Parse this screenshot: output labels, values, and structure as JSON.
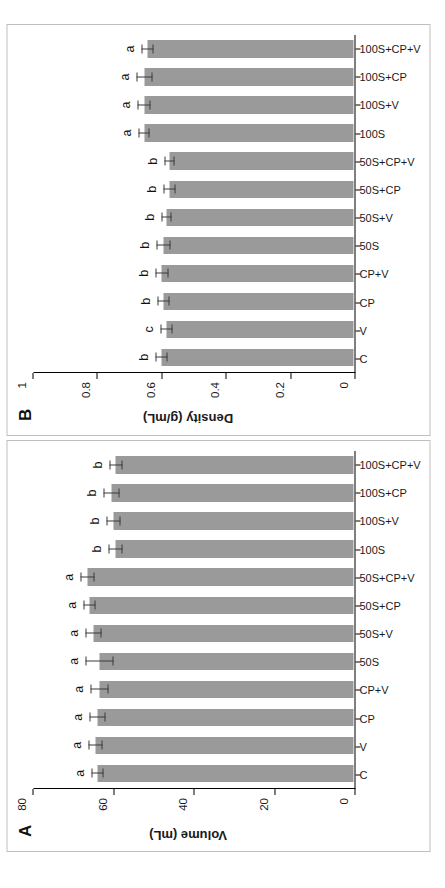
{
  "figure": {
    "background_color": "#ffffff",
    "bar_color": "#9a9a9a",
    "error_bar_color": "#3a3a3a",
    "axis_color": "#000000"
  },
  "chart_data": [
    {
      "type": "bar",
      "panel_label": "A",
      "title": "",
      "xlabel": "",
      "ylabel": "Volume (mL)",
      "ylim": [
        0,
        80
      ],
      "yticks": [
        0,
        20,
        40,
        60,
        80
      ],
      "ytick_labels": [
        "0",
        "20",
        "40",
        "60",
        "80"
      ],
      "grid": false,
      "legend": "none",
      "orientation": "vertical-bars-rotated-90ccw",
      "categories": [
        "C",
        "V",
        "CP",
        "CP+V",
        "50S",
        "50S+V",
        "50S+CP",
        "50S+CP+V",
        "100S",
        "100S+V",
        "100S+CP",
        "100S+CP+V"
      ],
      "values": [
        64.0,
        64.5,
        64.0,
        63.5,
        63.5,
        65.0,
        66.0,
        66.5,
        59.5,
        60.0,
        60.5,
        59.5
      ],
      "errors": [
        1.5,
        1.8,
        2.0,
        2.2,
        3.5,
        2.0,
        1.6,
        1.7,
        1.7,
        1.8,
        2.0,
        1.6
      ],
      "significance_letters": [
        "a",
        "a",
        "a",
        "a",
        "a",
        "a",
        "a",
        "a",
        "b",
        "b",
        "b",
        "b"
      ]
    },
    {
      "type": "bar",
      "panel_label": "B",
      "title": "",
      "xlabel": "",
      "ylabel": "Density (g/mL)",
      "ylim": [
        0,
        1
      ],
      "yticks": [
        0,
        0.2,
        0.4,
        0.6,
        0.8,
        1
      ],
      "ytick_labels": [
        "0",
        "0.2",
        "0.4",
        "0.6",
        "0.8",
        "1"
      ],
      "grid": false,
      "legend": "none",
      "orientation": "vertical-bars-rotated-90ccw",
      "categories": [
        "C",
        "V",
        "CP",
        "CP+V",
        "50S",
        "50S+V",
        "50S+CP",
        "50S+CP+V",
        "100S",
        "100S+V",
        "100S+CP",
        "100S+CP+V"
      ],
      "values": [
        0.6,
        0.585,
        0.595,
        0.6,
        0.595,
        0.585,
        0.575,
        0.575,
        0.655,
        0.655,
        0.655,
        0.645
      ],
      "errors": [
        0.018,
        0.018,
        0.018,
        0.02,
        0.022,
        0.016,
        0.018,
        0.016,
        0.018,
        0.02,
        0.025,
        0.018
      ],
      "significance_letters": [
        "b",
        "c",
        "b",
        "b",
        "b",
        "b",
        "b",
        "b",
        "a",
        "a",
        "a",
        "a"
      ]
    }
  ]
}
